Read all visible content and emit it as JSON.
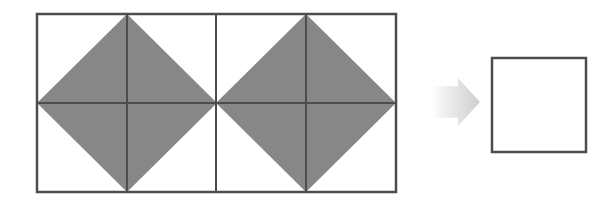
{
  "figure": {
    "background_color": "#ffffff",
    "stroke_color": "#4d4d4d",
    "shade_color": "#878787",
    "arrow_color": "#d9d9d9",
    "stroke_width": 2
  },
  "left_figure": {
    "name": "source-grid",
    "description": "Rectangle divided into 4 columns and 2 rows containing two shaded diamonds",
    "rect": {
      "x": 37,
      "y": 14,
      "width": 359,
      "height": 178
    },
    "columns": 4,
    "rows": 2,
    "vertical_dividers_x": [
      127,
      216,
      306
    ],
    "horizontal_dividers_y": [
      103
    ],
    "diamonds": [
      {
        "name": "diamond-left",
        "center_x": 127,
        "center_y": 103,
        "half_width": 90,
        "half_height": 89
      },
      {
        "name": "diamond-right",
        "center_x": 306,
        "center_y": 103,
        "half_width": 90,
        "half_height": 89
      }
    ]
  },
  "arrow": {
    "name": "transformation-arrow",
    "direction": "right",
    "x": 432,
    "y": 78,
    "width": 48,
    "height": 48
  },
  "right_figure": {
    "name": "result-square",
    "description": "Empty square outline",
    "rect": {
      "x": 492,
      "y": 58,
      "width": 94,
      "height": 94
    },
    "fill": "#ffffff"
  }
}
